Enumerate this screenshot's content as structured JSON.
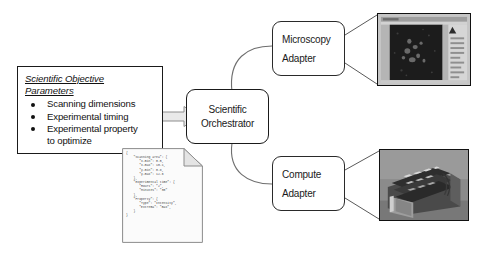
{
  "diagram": {
    "background_color": "#ffffff",
    "line_color": "#1a1a1a"
  },
  "params_box": {
    "title": "Scientific Objective Parameters",
    "title_line1": "Scientific Objective",
    "title_line2": "Parameters",
    "items": [
      {
        "text": "Scanning dimensions"
      },
      {
        "text": "Experimental timing"
      },
      {
        "text": "Experimental property",
        "continuation": "to optimize"
      }
    ]
  },
  "arrow": {
    "name": "flow-arrow",
    "direction": "right",
    "fill": "#e8e8e8",
    "stroke": "#8a8a8a"
  },
  "orchestrator": {
    "line1": "Scientific",
    "line2": "Orchestrator"
  },
  "adapters": [
    {
      "id": "microscopy",
      "line1": "Microscopy",
      "line2": "Adapter"
    },
    {
      "id": "compute",
      "line1": "Compute",
      "line2": "Adapter"
    }
  ],
  "json_note": {
    "label": "objective-parameters-json",
    "code": "{\n    \"Scanning area\": {\n       \"x-min\": 0.5,\n       \"x-max\": 10.1,\n       \"y-min\": 0.8,\n       \"y-max\": 12.6\n    },\n    \"Experimental time\": {\n       \"Hours\": \"2\",\n       \"Minutes\": \"30\"\n    },\n    \"Property\": {\n       \"Type\": \"Intensity\",\n       \"Extrema\": \"max\",\n    }\n}",
    "fields": {
      "scanning_area": {
        "x-min": 0.5,
        "x-max": 10.1,
        "y-min": 0.8,
        "y-max": 12.6
      },
      "experimental_time": {
        "Hours": "2",
        "Minutes": "30"
      },
      "property": {
        "Type": "Intensity",
        "Extrema": "max"
      }
    }
  },
  "photos": [
    {
      "id": "microscopy-photo",
      "caption": "microscopy acquisition software screenshot"
    },
    {
      "id": "compute-photo",
      "caption": "photograph of compute cluster hardware"
    }
  ]
}
